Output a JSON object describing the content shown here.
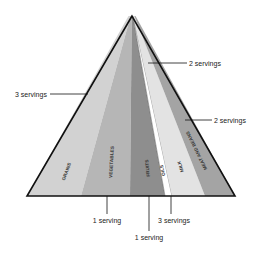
{
  "diagram": {
    "type": "food-pyramid",
    "apex": [
      132,
      16
    ],
    "base_y": 196,
    "base_left_x": 27,
    "base_right_x": 235,
    "groups": [
      {
        "name": "GRAINS",
        "color": "#d2d2d2",
        "base": [
          27,
          81
        ],
        "top_offset": [
          -3.5,
          -1.4
        ]
      },
      {
        "name": "VEGETABLES",
        "color": "#b6b6b6",
        "base": [
          81,
          130
        ],
        "top_offset": [
          -1.4,
          -0.2
        ]
      },
      {
        "name": "FRUITS",
        "color": "#8e8e8e",
        "base": [
          130,
          165
        ],
        "top_offset": [
          -0.2,
          0.8
        ]
      },
      {
        "name": "OILS",
        "color": "#ffffff",
        "base": [
          165,
          172
        ],
        "top_offset": [
          0.8,
          1.2
        ]
      },
      {
        "name": "MILK",
        "color": "#e3e3e3",
        "base": [
          172,
          205
        ],
        "top_offset": [
          1.2,
          2.4
        ]
      },
      {
        "name": "MEAT AND BEANS",
        "color": "#a4a4a4",
        "base": [
          205,
          235
        ],
        "top_offset": [
          2.4,
          3.5
        ]
      }
    ],
    "callouts": [
      {
        "text": "3 servings",
        "group": "GRAINS",
        "side": "left"
      },
      {
        "text": "2 servings",
        "group": "MILK",
        "side": "right-top"
      },
      {
        "text": "2 servings",
        "group": "MEAT AND BEANS",
        "side": "right"
      },
      {
        "text": "1 serving",
        "group": "VEGETABLES",
        "side": "bottom"
      },
      {
        "text": "1 serving",
        "group": "FRUITS",
        "side": "bottom-low"
      },
      {
        "text": "3 servings",
        "group": "OILS",
        "side": "bottom"
      }
    ],
    "outline_color": "#111111"
  }
}
